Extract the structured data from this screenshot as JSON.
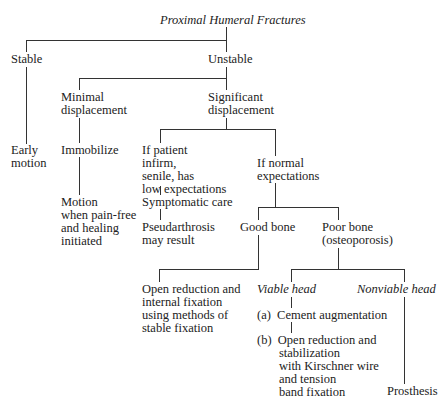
{
  "diagram": {
    "title": "Proximal Humeral Fractures",
    "nodes": {
      "stable": "Stable",
      "unstable": "Unstable",
      "early_motion": "Early\nmotion",
      "minimal_displacement": "Minimal\ndisplacement",
      "significant_displacement": "Significant\ndisplacement",
      "immobilize": "Immobilize",
      "motion": "Motion\nwhen pain-free\nand healing\ninitiated",
      "if_patient_infirm": "If patient\ninfirm,\nsenile, has\nlow expectations",
      "if_normal_expectations": "If normal\nexpectations",
      "symptomatic_care": "Symptomatic care",
      "pseudarthrosis": "Pseudarthrosis\nmay result",
      "good_bone": "Good bone",
      "poor_bone": "Poor bone\n(osteoporosis)",
      "open_reduction_internal": "Open reduction and\ninternal fixation\nusing methods of\nstable fixation",
      "viable_head": "Viable head",
      "nonviable_head": "Nonviable head",
      "cement_augmentation": "(a)  Cement augmentation",
      "open_reduction_stabilization": "(b)  Open reduction and\n       stabilization\n       with Kirschner wire\n       and tension\n       band fixation",
      "prosthesis": "Prosthesis"
    }
  }
}
